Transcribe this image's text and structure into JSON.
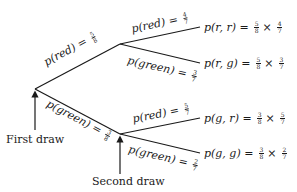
{
  "diagram": {
    "type": "probability-tree",
    "first_draw": {
      "red": {
        "label": "p(red)",
        "num": "5",
        "den": "8"
      },
      "green": {
        "label": "p(green)",
        "num": "3",
        "den": "8"
      }
    },
    "second_draw_after_red": {
      "red": {
        "label": "p(red)",
        "num": "4",
        "den": "7"
      },
      "green": {
        "label": "p(green)",
        "num": "3",
        "den": "7"
      }
    },
    "second_draw_after_green": {
      "red": {
        "label": "p(red)",
        "num": "5",
        "den": "7"
      },
      "green": {
        "label": "p(green)",
        "num": "2",
        "den": "7"
      }
    },
    "outcomes": [
      {
        "label": "p(r, r)",
        "a_num": "5",
        "a_den": "8",
        "b_num": "4",
        "b_den": "7"
      },
      {
        "label": "p(r, g)",
        "a_num": "5",
        "a_den": "8",
        "b_num": "3",
        "b_den": "7"
      },
      {
        "label": "p(g, r)",
        "a_num": "3",
        "a_den": "8",
        "b_num": "5",
        "b_den": "7"
      },
      {
        "label": "p(g, g)",
        "a_num": "3",
        "a_den": "8",
        "b_num": "2",
        "b_den": "7"
      }
    ],
    "equals": "=",
    "times": "×",
    "captions": {
      "first": "First draw",
      "second": "Second draw"
    }
  }
}
